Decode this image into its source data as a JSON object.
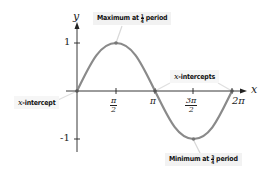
{
  "diagram": {
    "type": "sine-curve-annotated",
    "axes": {
      "x_label": "x",
      "y_label": "y",
      "y_ticks": [
        "1",
        "-1"
      ],
      "x_ticks": [
        {
          "num": "π",
          "den": "2"
        },
        {
          "text": "π"
        },
        {
          "num": "3π",
          "den": "2"
        },
        {
          "text": "2π"
        }
      ]
    },
    "annotations": {
      "maximum": {
        "prefix": "Maximum at",
        "frac_num": "1",
        "frac_den": "4",
        "suffix": "period"
      },
      "minimum": {
        "prefix": "Minimum at",
        "frac_num": "3",
        "frac_den": "4",
        "suffix": "period"
      },
      "x_intercepts": {
        "var": "x",
        "text": "-intercepts"
      },
      "x_intercept": {
        "var": "x",
        "text": "-intercept"
      }
    },
    "colors": {
      "curve": "#8a8a8a",
      "axis": "#222222",
      "callout_bg": "#f2f2f2",
      "leader": "#d8d8d8"
    }
  }
}
